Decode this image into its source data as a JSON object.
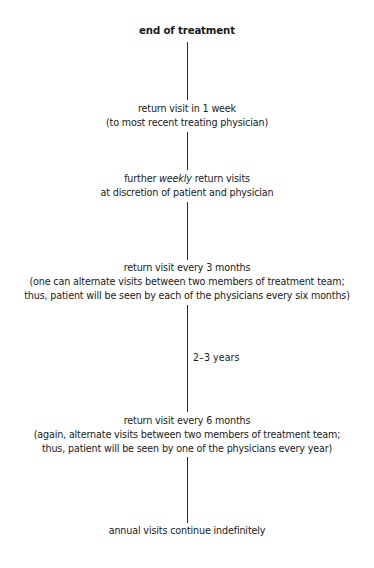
{
  "diagram": {
    "type": "vertical-flowchart",
    "title": "end of treatment",
    "line_color": "#2a2a2a",
    "nodes": [
      {
        "id": "end-of-treatment",
        "lines": [
          "end of treatment"
        ]
      },
      {
        "id": "return-1-week",
        "lines": [
          "return visit in 1 week",
          "(to most recent treating physician)"
        ]
      },
      {
        "id": "weekly-visits",
        "line1_prefix": "further ",
        "line1_emphasis": "weekly",
        "line1_suffix": " return visits",
        "line2": "at discretion of patient and physician"
      },
      {
        "id": "return-3-months",
        "lines": [
          "return visit every 3 months",
          "(one can alternate visits between two members of treatment team;",
          "thus, patient will be seen by each of the physicians every six months)"
        ]
      },
      {
        "id": "return-6-months",
        "lines": [
          "return visit every 6 months",
          "(again, alternate visits between two members of treatment team;",
          "thus, patient will be seen by one of the physicians every year)"
        ]
      },
      {
        "id": "annual-visits",
        "lines": [
          "annual visits continue indefinitely"
        ]
      }
    ],
    "edge_labels": {
      "three_to_six_months": "2–3 years"
    }
  }
}
